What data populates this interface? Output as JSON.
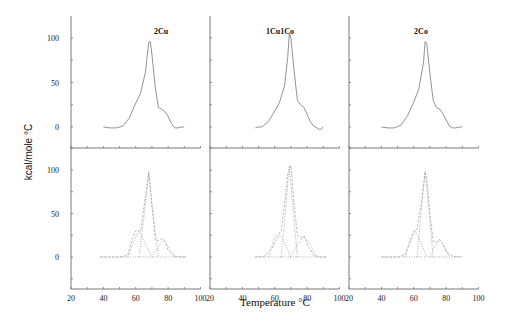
{
  "figure": {
    "ylabel": "kcal/mole °C",
    "xlabel": "Temperature °C",
    "panels": [
      {
        "title": "2Cu"
      },
      {
        "title": "1Cu1Co"
      },
      {
        "title": "2Co"
      }
    ],
    "xticks": [
      "20",
      "40",
      "60",
      "80",
      "100"
    ],
    "yticks_upper": [
      "0",
      "50",
      "100"
    ],
    "yticks_lower": [
      "0",
      "50",
      "100"
    ]
  },
  "chart_data": [
    {
      "type": "line",
      "title": "2Cu",
      "row": "upper (experimental)",
      "xlabel": "Temperature °C",
      "ylabel": "kcal/mole °C",
      "xlim": [
        20,
        100
      ],
      "ylim": [
        -25,
        125
      ],
      "series": [
        {
          "name": "2Cu experimental",
          "x": [
            40,
            44,
            48,
            52,
            56,
            60,
            63,
            66,
            68,
            69,
            70,
            72,
            74,
            76,
            78,
            80,
            82,
            84,
            86,
            88,
            90
          ],
          "y": [
            0,
            -1,
            -1,
            1,
            10,
            27,
            38,
            62,
            95,
            96,
            82,
            45,
            22,
            20,
            17,
            12,
            4,
            -1,
            -1,
            0,
            0
          ]
        }
      ]
    },
    {
      "type": "line",
      "title": "1Cu1Co",
      "row": "upper (experimental)",
      "xlim": [
        20,
        100
      ],
      "ylim": [
        -25,
        125
      ],
      "series": [
        {
          "name": "1Cu1Co experimental",
          "x": [
            48,
            50,
            52,
            56,
            60,
            63,
            66,
            68,
            69,
            70,
            72,
            74,
            76,
            78,
            80,
            82,
            84,
            86,
            88,
            90
          ],
          "y": [
            -1,
            0,
            0,
            6,
            18,
            28,
            46,
            78,
            105,
            100,
            62,
            30,
            25,
            22,
            14,
            6,
            1,
            -1,
            -3,
            0
          ]
        }
      ]
    },
    {
      "type": "line",
      "title": "2Co",
      "row": "upper (experimental)",
      "xlim": [
        20,
        100
      ],
      "ylim": [
        -25,
        125
      ],
      "series": [
        {
          "name": "2Co experimental",
          "x": [
            40,
            44,
            48,
            52,
            56,
            60,
            63,
            66,
            67,
            68,
            70,
            72,
            74,
            76,
            78,
            80,
            82,
            84,
            86,
            88,
            90
          ],
          "y": [
            0,
            -1,
            -1,
            2,
            12,
            28,
            42,
            72,
            96,
            94,
            60,
            30,
            22,
            20,
            15,
            8,
            1,
            -1,
            -1,
            0,
            0
          ]
        }
      ]
    },
    {
      "type": "line",
      "title": "2Cu deconvolution",
      "row": "lower (fitted components)",
      "xlim": [
        20,
        100
      ],
      "ylim": [
        -25,
        125
      ],
      "series": [
        {
          "name": "sum (dashed)",
          "x": [
            38,
            50,
            55,
            58,
            60,
            63,
            66,
            68,
            70,
            72,
            74,
            76,
            78,
            80,
            84,
            88,
            91
          ],
          "y": [
            0,
            0,
            2,
            22,
            30,
            30,
            70,
            98,
            60,
            20,
            19,
            21,
            18,
            8,
            1,
            0,
            0
          ]
        },
        {
          "name": "component 1",
          "x": [
            55,
            58,
            62,
            66,
            70
          ],
          "y": [
            0,
            15,
            30,
            15,
            0
          ]
        },
        {
          "name": "component 2",
          "x": [
            62,
            66,
            68,
            70,
            74
          ],
          "y": [
            0,
            60,
            98,
            60,
            0
          ]
        },
        {
          "name": "component 3",
          "x": [
            70,
            74,
            77,
            80,
            84
          ],
          "y": [
            0,
            12,
            20,
            12,
            0
          ]
        },
        {
          "name": "baseline",
          "x": [
            38,
            91
          ],
          "y": [
            0,
            0
          ]
        }
      ]
    },
    {
      "type": "line",
      "title": "1Cu1Co deconvolution",
      "row": "lower (fitted components)",
      "xlim": [
        20,
        100
      ],
      "ylim": [
        -25,
        125
      ],
      "series": [
        {
          "name": "sum (dashed)",
          "x": [
            48,
            54,
            58,
            60,
            62,
            64,
            66,
            68,
            70,
            72,
            74,
            76,
            78,
            80,
            84,
            88,
            92
          ],
          "y": [
            0,
            1,
            10,
            22,
            26,
            30,
            60,
            95,
            105,
            60,
            25,
            22,
            24,
            15,
            2,
            0,
            0
          ]
        },
        {
          "name": "component 1",
          "x": [
            56,
            60,
            63,
            66,
            70
          ],
          "y": [
            0,
            16,
            26,
            16,
            0
          ]
        },
        {
          "name": "component 2",
          "x": [
            64,
            67,
            69,
            71,
            74
          ],
          "y": [
            0,
            60,
            105,
            60,
            0
          ]
        },
        {
          "name": "component 3",
          "x": [
            70,
            74,
            78,
            82,
            86
          ],
          "y": [
            0,
            14,
            24,
            14,
            0
          ]
        },
        {
          "name": "baseline",
          "x": [
            48,
            92
          ],
          "y": [
            0,
            0
          ]
        }
      ]
    },
    {
      "type": "line",
      "title": "2Co deconvolution",
      "row": "lower (fitted components)",
      "xlim": [
        20,
        100
      ],
      "ylim": [
        -25,
        125
      ],
      "series": [
        {
          "name": "sum (dashed)",
          "x": [
            40,
            50,
            55,
            58,
            60,
            62,
            65,
            67,
            68,
            70,
            72,
            74,
            76,
            78,
            80,
            84,
            90
          ],
          "y": [
            0,
            0,
            3,
            20,
            30,
            32,
            65,
            98,
            90,
            50,
            18,
            17,
            20,
            15,
            6,
            1,
            0
          ]
        },
        {
          "name": "component 1",
          "x": [
            54,
            58,
            61,
            64,
            68
          ],
          "y": [
            0,
            18,
            30,
            18,
            0
          ]
        },
        {
          "name": "component 2",
          "x": [
            62,
            65,
            67,
            69,
            72
          ],
          "y": [
            0,
            60,
            98,
            60,
            0
          ]
        },
        {
          "name": "component 3",
          "x": [
            70,
            73,
            76,
            79,
            82
          ],
          "y": [
            0,
            12,
            20,
            12,
            0
          ]
        },
        {
          "name": "baseline",
          "x": [
            40,
            90
          ],
          "y": [
            0,
            0
          ]
        }
      ]
    }
  ]
}
